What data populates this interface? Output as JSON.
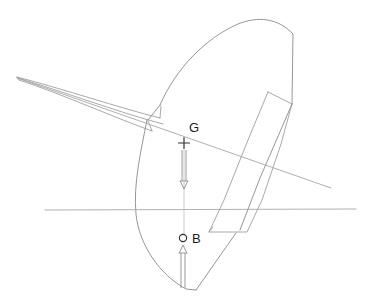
{
  "diagram": {
    "type": "naval-architecture-stability-section",
    "canvas": {
      "width": 370,
      "height": 302,
      "background": "#ffffff"
    },
    "colors": {
      "hull_outline": "#8a8a8a",
      "keel_outline": "#9a9a9a",
      "appendage_outline": "#9a9a9a",
      "waterline": "#a3a3a3",
      "heel_axis": "#a0a0a0",
      "centerline": "#bdbdbd",
      "force_arrow": "#8f8f8f",
      "marker": "#2e2e2e",
      "label_text": "#1a1a1a"
    },
    "labels": {
      "center_of_gravity": "G",
      "center_of_buoyancy": "B"
    },
    "markers": {
      "center_of_gravity": {
        "glyph": "plus",
        "x": 184,
        "y": 143,
        "size": 7
      },
      "center_of_buoyancy": {
        "glyph": "circle",
        "x": 183,
        "y": 238,
        "radius": 3.6
      }
    },
    "label_positions": {
      "center_of_gravity": {
        "x": 189,
        "y": 132
      },
      "center_of_buoyancy": {
        "x": 192,
        "y": 243
      }
    },
    "arrows": {
      "weight_vector": {
        "name": "gravity-force-arrow",
        "direction": "down",
        "from_x": 184,
        "from_y": 150,
        "to_x": 184,
        "to_y": 188,
        "shaft_half_width": 2.0,
        "head_half_width": 3.8,
        "head_length": 7
      },
      "buoyancy_vector": {
        "name": "buoyancy-force-arrow",
        "direction": "up",
        "from_x": 183,
        "from_y": 288,
        "to_x": 183,
        "to_y": 246,
        "shaft_half_width": 2.0,
        "head_half_width": 3.8,
        "head_length": 7
      }
    },
    "reference_lines": {
      "waterline": {
        "name": "waterline",
        "x1": 45,
        "y1": 210,
        "x2": 356,
        "y2": 209
      },
      "heel_axis": {
        "name": "heel-axis-line",
        "x1": 17,
        "y1": 78,
        "x2": 331,
        "y2": 188
      },
      "centerline_upper": {
        "name": "hull-centerline-upper",
        "x1": 184,
        "y1": 150,
        "x2": 184,
        "y2": 232
      },
      "centerline_lower": {
        "name": "hull-centerline-lower",
        "x1": 184,
        "y1": 190,
        "x2": 184,
        "y2": 234
      }
    },
    "paths": {
      "hull_body_outline": "M 160 105 C 176 68 206 38 238 24 C 258 16 278 18 293 34 L 293 34 L 292 104",
      "hull_lower_outline": "M 147 120 C 141 150 133 185 136 214 C 139 245 160 275 186 289 L 196 290",
      "hull_deck_right": "M 292 104 L 260 178 L 240 230",
      "hull_stern_edge": "M 196 290 L 236 233",
      "hull_root_notch": "M 160 105 L 148 120",
      "keel_upper_edge": "M 17 77 C 60 88 120 108 160 118",
      "keel_lower_edge": "M 19 80 C 62 94 118 119 152 131",
      "keel_tip_cap": "M 17 77 L 19 80",
      "keel_mid_line": "M 18 78 C 64 92 124 114 163 124",
      "keel_root_fair": "M 160 118 L 161 106",
      "keel_root_fair2": "M 152 131 L 148 121",
      "rudder_outline": "M 292 104 L 281 144 L 262 200 L 247 232 L 209 232 L 224 200 L 248 140 L 268 92",
      "rudder_leading": "M 268 92 L 292 104",
      "skeg_line": "M 209 232 L 213 227"
    }
  }
}
